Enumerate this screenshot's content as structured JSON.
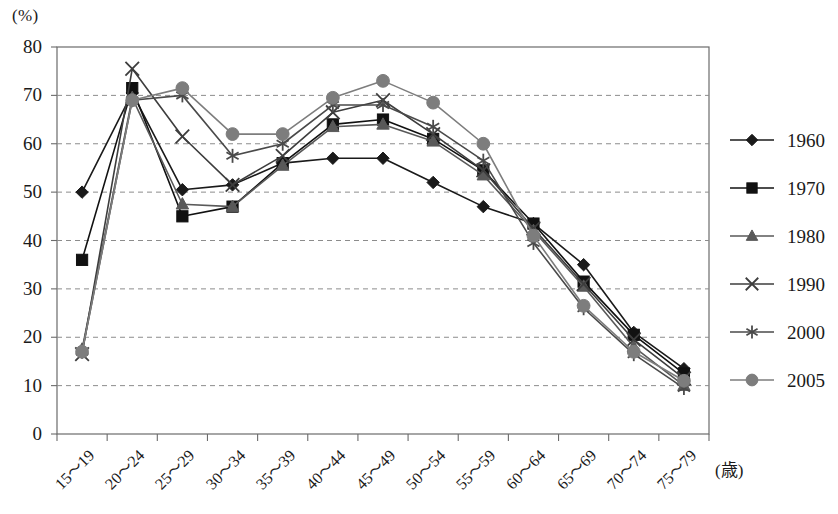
{
  "chart_data": {
    "type": "line",
    "title": "",
    "xlabel": "(歳)",
    "ylabel": "(%)",
    "ylim": [
      0,
      80
    ],
    "ytick_step": 10,
    "yticks": [
      "0",
      "10",
      "20",
      "30",
      "40",
      "50",
      "60",
      "70",
      "80"
    ],
    "grid": true,
    "grid_style": "dashed-horizontal",
    "legend_position": "right",
    "categories": [
      "15〜19",
      "20〜24",
      "25〜29",
      "30〜34",
      "35〜39",
      "40〜44",
      "45〜49",
      "50〜54",
      "55〜59",
      "60〜64",
      "65〜69",
      "70〜74",
      "75〜79"
    ],
    "series": [
      {
        "name": "1960",
        "marker": "diamond",
        "color": "#1a1a1a",
        "values": [
          50.0,
          70.5,
          50.5,
          51.5,
          56.0,
          57.0,
          57.0,
          52.0,
          47.0,
          43.5,
          35.0,
          21.0,
          13.5
        ]
      },
      {
        "name": "1970",
        "marker": "square",
        "color": "#111111",
        "values": [
          36.0,
          71.5,
          45.0,
          47.0,
          56.0,
          64.0,
          65.0,
          61.0,
          54.5,
          43.5,
          31.5,
          20.5,
          12.5
        ]
      },
      {
        "name": "1980",
        "marker": "triangle",
        "color": "#595959",
        "values": [
          17.5,
          69.5,
          47.5,
          47.0,
          55.5,
          63.5,
          64.0,
          60.5,
          53.5,
          42.0,
          30.5,
          18.0,
          10.0
        ]
      },
      {
        "name": "1990",
        "marker": "cross-x",
        "color": "#3d3d3d",
        "values": [
          16.5,
          75.5,
          61.5,
          51.5,
          57.5,
          66.5,
          69.0,
          62.0,
          54.5,
          42.5,
          31.0,
          19.5,
          11.5
        ]
      },
      {
        "name": "2000",
        "marker": "asterisk",
        "color": "#4a4a4a",
        "values": [
          17.0,
          69.0,
          70.0,
          57.5,
          60.0,
          68.0,
          68.0,
          63.5,
          56.5,
          39.5,
          26.0,
          16.5,
          9.5
        ]
      },
      {
        "name": "2005",
        "marker": "circle",
        "color": "#7d7d7d",
        "values": [
          17.0,
          69.0,
          71.5,
          62.0,
          62.0,
          69.5,
          73.0,
          68.5,
          60.0,
          41.0,
          26.5,
          17.0,
          11.0
        ]
      }
    ]
  },
  "legend": {
    "entries": [
      "1960",
      "1970",
      "1980",
      "1990",
      "2000",
      "2005"
    ]
  },
  "axes": {
    "y_unit": "(%)",
    "x_unit": "(歳)"
  }
}
